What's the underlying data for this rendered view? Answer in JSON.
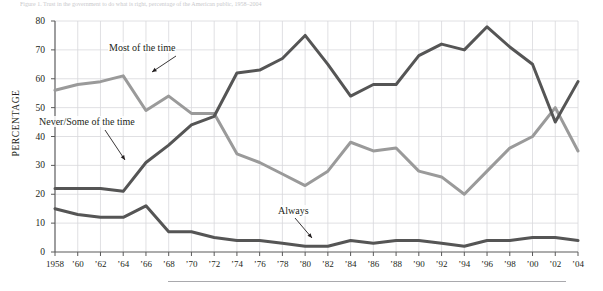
{
  "figure": {
    "caption_top": "Figure 1.  Trust in the government to do what is right, percentage of the American public, 1958–2004",
    "bottom_rule": "horizontal-rule"
  },
  "axes": {
    "ylabel": "PERCENTAGE",
    "yticks": [
      "80",
      "70",
      "60",
      "50",
      "40",
      "30",
      "20",
      "10",
      "0"
    ],
    "xticks": [
      "1958",
      "’60",
      "’62",
      "’64",
      "’66",
      "’68",
      "’70",
      "’72",
      "’74",
      "’76",
      "’78",
      "’80",
      "’82",
      "’84",
      "’86",
      "’88",
      "’90",
      "’92",
      "’94",
      "’96",
      "’98",
      "’00",
      "’02",
      "’04"
    ]
  },
  "annotations": [
    {
      "name": "most-of-the-time",
      "text": "Most of the time"
    },
    {
      "name": "never-some-of-the-time",
      "text": "Never/Some of the time"
    },
    {
      "name": "always",
      "text": "Always"
    }
  ],
  "colors": {
    "most_of_the_time": "#9a9a9a",
    "never_some_of_the_time": "#555555",
    "always": "#555555",
    "grid": "#d8d8dc",
    "axis": "#5a5a5a",
    "text": "#231f20"
  },
  "chart_data": {
    "type": "line",
    "title": "",
    "xlabel": "",
    "ylabel": "PERCENTAGE",
    "xlim": [
      1958,
      2004
    ],
    "ylim": [
      0,
      80
    ],
    "grid": true,
    "legend": "inline-annotations",
    "x": [
      1958,
      1960,
      1962,
      1964,
      1966,
      1968,
      1970,
      1972,
      1974,
      1976,
      1978,
      1980,
      1982,
      1984,
      1986,
      1988,
      1990,
      1992,
      1994,
      1996,
      1998,
      2000,
      2002,
      2004
    ],
    "series": [
      {
        "name": "Most of the time",
        "color": "#9a9a9a",
        "values": [
          56,
          58,
          59,
          61,
          49,
          54,
          48,
          48,
          34,
          31,
          27,
          23,
          28,
          38,
          35,
          36,
          28,
          26,
          20,
          28,
          36,
          40,
          50,
          35
        ]
      },
      {
        "name": "Never/Some of the time",
        "color": "#555555",
        "values": [
          22,
          22,
          22,
          21,
          31,
          37,
          44,
          47,
          62,
          63,
          67,
          75,
          65,
          54,
          58,
          58,
          68,
          72,
          70,
          78,
          71,
          65,
          45,
          59
        ]
      },
      {
        "name": "Always",
        "color": "#555555",
        "values": [
          15,
          13,
          12,
          12,
          16,
          7,
          7,
          5,
          4,
          4,
          3,
          2,
          2,
          4,
          3,
          4,
          4,
          3,
          2,
          4,
          4,
          5,
          5,
          4
        ]
      }
    ]
  }
}
